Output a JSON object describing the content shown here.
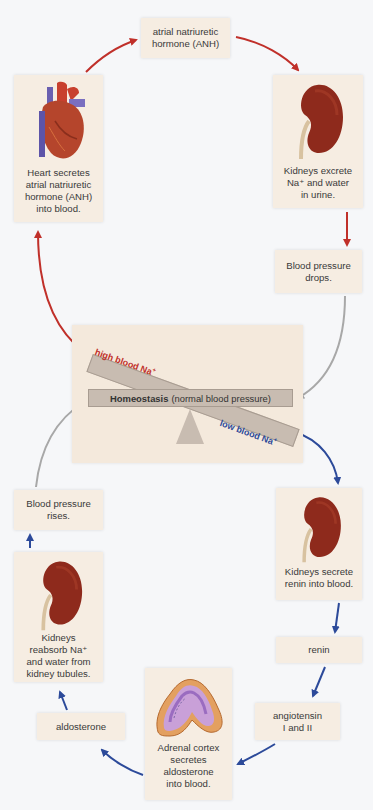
{
  "diagram": {
    "colors": {
      "background": "#f6f7f9",
      "box": "#f6ede2",
      "panel": "#f4e9dc",
      "balance_bar": "#c8bcb1",
      "high_na_arrow": "#c0302a",
      "low_na_arrow": "#2c4a9a",
      "return_arrow": "#a8a8a8",
      "kidney": "#8e2a1c"
    },
    "center": {
      "homeostasis_bold": "Homeostasis",
      "homeostasis_rest": "(normal blood pressure)",
      "high_label": "high blood Na",
      "high_sup": "+",
      "low_label": "low blood Na",
      "low_sup": "+"
    },
    "high_pathway": [
      {
        "id": "heart",
        "icon": "heart-icon",
        "text": "Heart secretes\natrial natriuretic\nhormone (ANH)\ninto blood."
      },
      {
        "id": "anh",
        "text": "atrial natriuretic\nhormone (ANH)"
      },
      {
        "id": "kidney-excrete",
        "icon": "kidney-icon",
        "text": "Kidneys excrete\nNa⁺ and water\nin urine."
      },
      {
        "id": "bp-drops",
        "text": "Blood pressure\ndrops."
      }
    ],
    "low_pathway": [
      {
        "id": "kidney-renin",
        "icon": "kidney-icon",
        "text": "Kidneys secrete\nrenin into blood."
      },
      {
        "id": "renin",
        "text": "renin"
      },
      {
        "id": "angiotensin",
        "text": "angiotensin\nI and II"
      },
      {
        "id": "adrenal",
        "icon": "adrenal-gland-icon",
        "text": "Adrenal cortex\nsecretes\naldosterone\ninto blood."
      },
      {
        "id": "aldosterone",
        "text": "aldosterone"
      },
      {
        "id": "kidney-reabsorb",
        "icon": "kidney-icon",
        "text": "Kidneys\nreabsorb Na⁺\nand water from\nkidney tubules."
      },
      {
        "id": "bp-rises",
        "text": "Blood pressure\nrises."
      }
    ]
  }
}
